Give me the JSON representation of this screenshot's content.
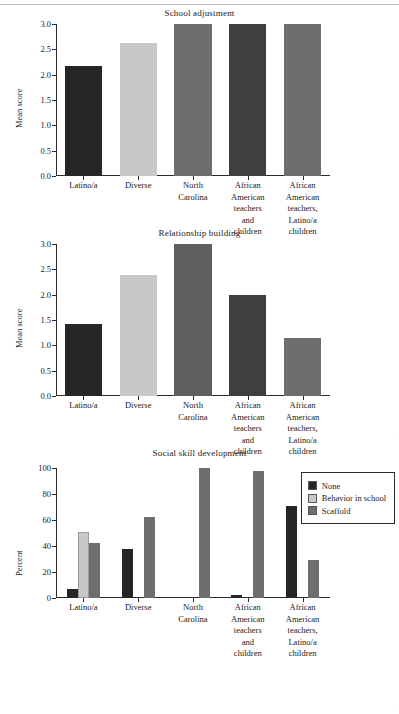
{
  "figure": {
    "background": "#ffffff",
    "series_colors": {
      "none": "#262626",
      "behavior_in_school": "#c8c8c8",
      "scaffold": "#6e6e6e",
      "dark_alt": "#474747"
    }
  },
  "legend": {
    "position": "top-right",
    "items": [
      {
        "label": "None",
        "color": "#262626"
      },
      {
        "label": "Behavior in school",
        "color": "#c8c8c8"
      },
      {
        "label": "Scaffold",
        "color": "#6e6e6e"
      }
    ]
  },
  "categories": [
    "Latino/a",
    "Diverse",
    "North\nCarolina",
    "African\nAmerican\nteachers\nand\nchildren",
    "African\nAmerican\nteachers,\nLatino/a\nchildren"
  ],
  "chart_data": [
    {
      "type": "bar",
      "title": "School adjustment",
      "xlabel": "",
      "ylabel": "Mean score",
      "ylim": [
        0,
        3.0
      ],
      "yticks": [
        "0.0",
        "0.5",
        "1.0",
        "1.5",
        "2.0",
        "2.5",
        "3.0"
      ],
      "ytick_values": [
        0,
        0.5,
        1.0,
        1.5,
        2.0,
        2.5,
        3.0
      ],
      "grid": false,
      "categories": [
        "Latino/a",
        "Diverse",
        "North\nCarolina",
        "African\nAmerican\nteachers\nand\nchildren",
        "African\nAmerican\nteachers,\nLatino/a\nchildren"
      ],
      "values": [
        2.18,
        2.63,
        3.0,
        3.0,
        3.0
      ],
      "bar_colors": [
        "#262626",
        "#c8c8c8",
        "#6e6e6e",
        "#3f3f3f",
        "#6e6e6e"
      ]
    },
    {
      "type": "bar",
      "title": "Relationship building",
      "xlabel": "",
      "ylabel": "Mean score",
      "ylim": [
        0,
        3.0
      ],
      "yticks": [
        "0.0",
        "0.5",
        "1.0",
        "1.5",
        "2.0",
        "2.5",
        "3.0"
      ],
      "ytick_values": [
        0,
        0.5,
        1.0,
        1.5,
        2.0,
        2.5,
        3.0
      ],
      "grid": false,
      "categories": [
        "Latino/a",
        "Diverse",
        "North\nCarolina",
        "African\nAmerican\nteachers\nand\nchildren",
        "African\nAmerican\nteachers,\nLatino/a\nchildren"
      ],
      "values": [
        1.42,
        2.38,
        3.0,
        2.0,
        1.15
      ],
      "bar_colors": [
        "#262626",
        "#c8c8c8",
        "#5e5e5e",
        "#3f3f3f",
        "#6e6e6e"
      ]
    },
    {
      "type": "bar",
      "title": "Social skill development",
      "xlabel": "",
      "ylabel": "Percent",
      "ylim": [
        0,
        100
      ],
      "yticks": [
        "0",
        "20",
        "40",
        "60",
        "80",
        "100"
      ],
      "ytick_values": [
        0,
        20,
        40,
        60,
        80,
        100
      ],
      "grid": false,
      "grouped": true,
      "categories": [
        "Latino/a",
        "Diverse",
        "North\nCarolina",
        "African\nAmerican\nteachers\nand\nchildren",
        "African\nAmerican\nteachers,\nLatino/a\nchildren"
      ],
      "series": [
        {
          "name": "None",
          "color": "#262626",
          "values": [
            7,
            38,
            0,
            2,
            71
          ]
        },
        {
          "name": "Behavior in school",
          "color": "#c8c8c8",
          "values": [
            51,
            0,
            0,
            0,
            0
          ]
        },
        {
          "name": "Scaffold",
          "color": "#6e6e6e",
          "values": [
            42,
            62,
            100,
            98,
            29
          ]
        }
      ]
    }
  ]
}
